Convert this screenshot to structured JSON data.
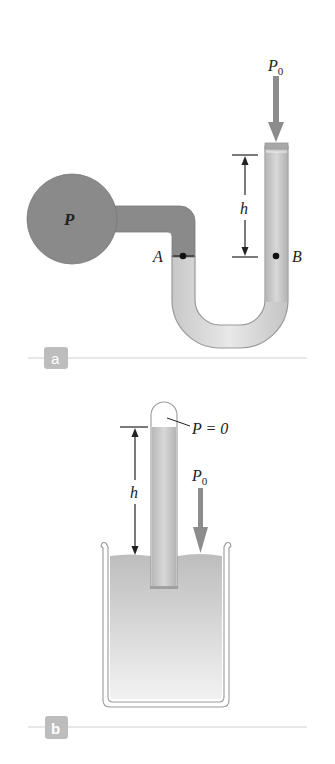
{
  "figure": {
    "panels": [
      {
        "tag": "a",
        "title": "Open-tube manometer",
        "labels": {
          "container_pressure": "P",
          "atmospheric": "P",
          "atmospheric_sub": "0",
          "height": "h",
          "point_left": "A",
          "point_right": "B"
        }
      },
      {
        "tag": "b",
        "title": "Mercury barometer",
        "labels": {
          "vacuum": "P = 0",
          "atmospheric": "P",
          "atmospheric_sub": "0",
          "height": "h"
        }
      }
    ],
    "colors": {
      "gas_fill": "#8a8a8a",
      "liquid_fill": "#d6d6d6",
      "tube_outline": "#9a9a9a",
      "arrow": "#8c8c8c",
      "tag_bg": "#bdbdbd",
      "rule": "#d0d0d0",
      "ink": "#222222"
    }
  }
}
